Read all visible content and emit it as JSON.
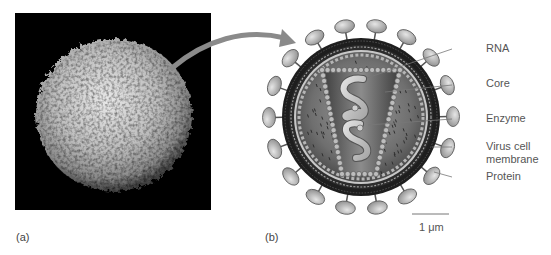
{
  "figure": {
    "panels": [
      {
        "id": "a",
        "label": "(a)",
        "description": "Scanning electron micrograph of a cell (white blood cell) on black background"
      },
      {
        "id": "b",
        "label": "(b)",
        "description": "Cross-section diagram of a virus particle"
      }
    ],
    "callouts": [
      {
        "name": "rna",
        "text": "RNA"
      },
      {
        "name": "core",
        "text": "Core"
      },
      {
        "name": "enzyme",
        "text": "Enzyme"
      },
      {
        "name": "virus-cell-membrane",
        "text_line1": "Virus cell",
        "text_line2": "membrane"
      },
      {
        "name": "protein",
        "text": "Protein"
      }
    ],
    "scale_bar": {
      "label": "1 μm"
    },
    "colors": {
      "arrow": "#8a8a8a",
      "membrane_dark": "#2a2a2a",
      "protein_spike": "#bcbcbc",
      "core_fill": "#6e6e6e",
      "interior": "#7d7d7d",
      "rna": "#c9c9c9",
      "label_text": "#555555",
      "leader_line": "#777777"
    }
  }
}
